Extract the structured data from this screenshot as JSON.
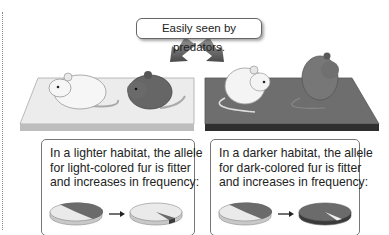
{
  "callout": {
    "text": "Easily seen by predators."
  },
  "colors": {
    "light": "#e9e9e9",
    "dark": "#6b6b6b",
    "dark_edge": "#3a3a3a",
    "light_edge": "#c6c6c6"
  },
  "panels": [
    {
      "id": "lighter",
      "lines": [
        "In a lighter habitat, the allele",
        "for light-colored fur is fitter",
        "and increases in frequency:"
      ],
      "before": {
        "light_frac": 0.55,
        "dark_frac": 0.45
      },
      "after": {
        "light_frac": 0.92,
        "dark_frac": 0.08
      }
    },
    {
      "id": "darker",
      "lines": [
        "In a darker habitat, the allele",
        "for dark-colored fur is fitter",
        "and increases in frequency:"
      ],
      "before": {
        "light_frac": 0.55,
        "dark_frac": 0.45
      },
      "after": {
        "light_frac": 0.06,
        "dark_frac": 0.94
      }
    }
  ]
}
